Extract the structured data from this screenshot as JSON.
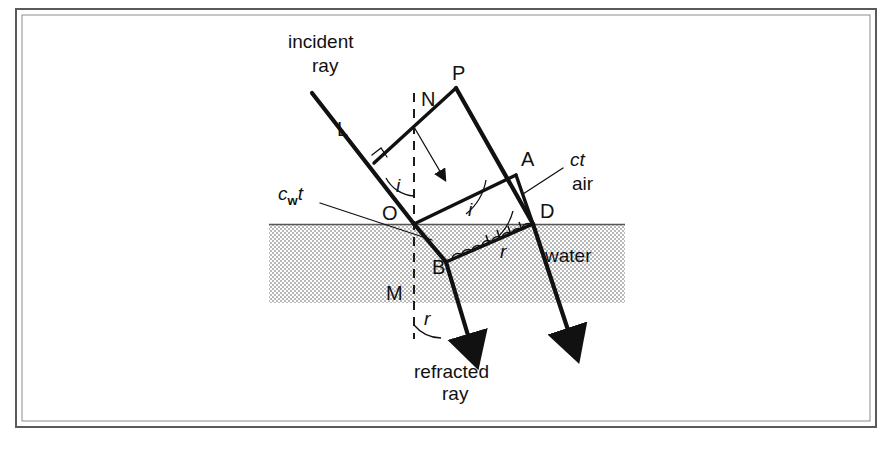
{
  "figure": {
    "background_color": "#ffffff",
    "ink_color": "#111111",
    "water_fill_color": "#d2d2d2",
    "frame_color": "#5a5a5a"
  },
  "labels": {
    "incident_ray_line1": "incident",
    "incident_ray_line2": "ray",
    "refracted_ray_line1": "refracted",
    "refracted_ray_line2": "ray",
    "air": "air",
    "water": "water",
    "point_L": "L",
    "point_P": "P",
    "point_N": "N",
    "point_A": "A",
    "point_O": "O",
    "point_D": "D",
    "point_B": "B",
    "point_M": "M",
    "angle_i_upper": "i",
    "angle_i_lower": "i",
    "angle_r_upper": "r",
    "angle_r_lower": "r",
    "ct_label": "ct",
    "cwt_label_main": "c",
    "cwt_label_sub": "w",
    "cwt_label_tail": "t"
  },
  "geometry": {
    "frame": {
      "x": 16,
      "y": 9,
      "width": 860,
      "height": 418
    },
    "water_band": {
      "x": 269,
      "y": 224,
      "width": 356,
      "height": 79
    },
    "surface_y": 224,
    "normal_x": 414,
    "points": {
      "L_ray_top": [
        312,
        93
      ],
      "O": [
        414,
        224
      ],
      "P": [
        456,
        88
      ],
      "A": [
        516,
        175
      ],
      "D": [
        533,
        224
      ],
      "B": [
        446,
        262
      ],
      "wavefront_left_upper": [
        374,
        163
      ],
      "refracted_ray_end": [
        475,
        352
      ],
      "right_ray_end": [
        575,
        345
      ],
      "cwt_leader_start": [
        318,
        202
      ],
      "cwt_leader_end": [
        430,
        238
      ],
      "ct_leader_start": [
        566,
        166
      ],
      "ct_leader_end": [
        524,
        192
      ]
    }
  },
  "annotations": {
    "wavefront_LP": "initial wavefront in air from L to P",
    "wavefront_OA": "wavefront OA, angle i to the surface",
    "wavefront_BD": "refracted wavefront BD with Huygens wavelets, angle r",
    "ct_meaning": "distance travelled in air in time t",
    "cwt_meaning": "distance travelled in water in time t"
  }
}
